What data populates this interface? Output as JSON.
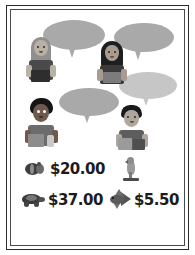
{
  "worksheet": {
    "title": "Pet shop prices word problem",
    "background_color": "#ffffff",
    "frame_color": "#2b2b2b"
  },
  "speech_bubbles": [
    {
      "id": "bubble-1",
      "speaker": "girl-blonde",
      "text": "",
      "fill": "#a9a9a9"
    },
    {
      "id": "bubble-2",
      "speaker": "girl-dark-hair",
      "text": "",
      "fill": "#a9a9a9"
    },
    {
      "id": "bubble-3",
      "speaker": "boy-curly",
      "text": "",
      "fill": "#a9a9a9"
    },
    {
      "id": "bubble-4",
      "speaker": "boy-short-hair",
      "text": "",
      "fill": "#c6c6c6"
    }
  ],
  "characters": [
    {
      "id": "girl-blonde",
      "name": "girl-with-blonde-hair",
      "hair_color": "#8a8a8a",
      "skin_color": "#b9b0a6",
      "shirt_color": "#4a4a4a"
    },
    {
      "id": "girl-dark-hair",
      "name": "girl-with-dark-hair",
      "hair_color": "#1e1e1e",
      "skin_color": "#a89c90",
      "shirt_color": "#3a3a3a"
    },
    {
      "id": "boy-curly",
      "name": "boy-with-curly-hair",
      "hair_color": "#151515",
      "skin_color": "#6e5a4c",
      "shirt_color": "#6c6c6c"
    },
    {
      "id": "boy-short-hair",
      "name": "boy-with-short-hair",
      "hair_color": "#1a1a1a",
      "skin_color": "#b0a79c",
      "shirt_color": "#5e5e5e"
    }
  ],
  "price_list": {
    "rows": [
      {
        "items": [
          {
            "icon": "hamster-icon",
            "animal": "hamster",
            "price": "$20.00"
          },
          {
            "icon": "parrot-icon",
            "animal": "parrot",
            "price": ""
          }
        ]
      },
      {
        "items": [
          {
            "icon": "turtle-icon",
            "animal": "turtle",
            "price": "$37.00"
          },
          {
            "icon": "fish-icon",
            "animal": "fish",
            "price": "$5.50"
          }
        ]
      }
    ],
    "prices": [
      "$20.00",
      "$37.00",
      "$5.50"
    ],
    "currency": "$"
  }
}
